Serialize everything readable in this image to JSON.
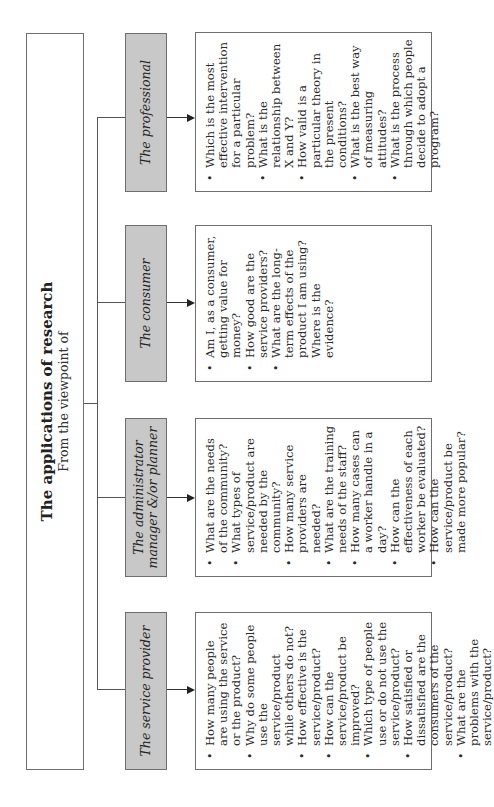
{
  "diagram": {
    "title": "The applications of research",
    "subtitle": "From the viewpoint of",
    "viewpoints": [
      {
        "role": "The service provider",
        "questions": [
          "How many people are using the service or the product?",
          "Why do some people use the service/product while others do not?",
          "How effective is the service/product?",
          "How can the service/product be improved?",
          "Which type of people use or do not use the service/product?",
          "How satisfied or dissatisfied are the consumers of the service/product?",
          "What are the problems with the service/product?"
        ]
      },
      {
        "role": "The administrator manager &/or planner",
        "questions": [
          "What are the needs of the community?",
          "What types of service/product are needed by the community?",
          "How many service providers are needed?",
          "What are the training needs of the staff?",
          "How many cases can a worker handle in a day?",
          "How can the effectiveness of each worker be evaluated?",
          "How can the service/product be made more popular?"
        ]
      },
      {
        "role": "The consumer",
        "questions": [
          "Am I, as a consumer, getting value for money?",
          "How good are the service providers?",
          "What are the long-term effects of the product I am using? Where is the evidence?"
        ]
      },
      {
        "role": "The professional",
        "questions": [
          "Which is the most effective intervention for a particular problem?",
          "What is the relationship between X and Y?",
          "How valid is a particular theory in the present conditions?",
          "What is the best way of measuring attitudes?",
          "What is the process through which people decide to adopt a program?"
        ]
      }
    ],
    "colors": {
      "role_box_fill": "#c8c8c8",
      "border": "#6e6e6e",
      "background": "#ffffff"
    }
  }
}
